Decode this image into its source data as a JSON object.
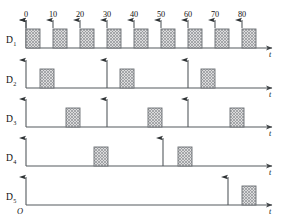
{
  "figure": {
    "origin_label": "O",
    "axis_label": "t",
    "tick_labels": [
      "0",
      "10",
      "20",
      "30",
      "40",
      "50",
      "60",
      "70",
      "80"
    ],
    "tick_x": [
      26,
      53,
      80,
      107,
      134,
      161,
      188,
      215,
      242
    ],
    "colors": {
      "line": "#555a5e",
      "pulse_fill": "#cfd0d1",
      "pulse_stroke": "#6b6f73",
      "text": "#111111",
      "background": "#ffffff"
    },
    "geometry": {
      "axis_x_start": 26,
      "axis_x_end": 272,
      "pulse_width": 14,
      "pulse_height": 19,
      "tick_spacing": 27
    }
  },
  "chart_data": {
    "type": "timing-diagram",
    "xlabel": "t",
    "xlim": [
      0,
      91
    ],
    "x_ticks": [
      0,
      10,
      20,
      30,
      40,
      50,
      60,
      70,
      80
    ],
    "x_tick_labels": [
      "0",
      "10",
      "20",
      "30",
      "40",
      "50",
      "60",
      "70",
      "80"
    ],
    "grid": false,
    "legend": "none",
    "origin": "O",
    "rows": [
      {
        "name": "D1",
        "label": "D",
        "subscript": "1",
        "baseline_y": 48,
        "top_ticks": true,
        "tick_arrow_x": [
          26,
          53,
          80,
          107,
          134,
          161,
          188,
          215,
          242
        ],
        "pulses_x": [
          26,
          53,
          80,
          107,
          134,
          161,
          188,
          215,
          242
        ],
        "pulses_t": [
          0,
          10,
          20,
          30,
          40,
          50,
          60,
          70,
          80
        ],
        "arrows_x": [],
        "arrows_t": []
      },
      {
        "name": "D2",
        "label": "D",
        "subscript": "2",
        "baseline_y": 88,
        "top_ticks": false,
        "tick_arrow_x": [],
        "pulses_x": [
          40,
          120,
          201
        ],
        "pulses_t": [
          5,
          35,
          65
        ],
        "arrows_x": [
          26,
          107,
          188
        ],
        "arrows_t": [
          0,
          30,
          60
        ]
      },
      {
        "name": "D3",
        "label": "D",
        "subscript": "3",
        "baseline_y": 127,
        "top_ticks": false,
        "tick_arrow_x": [],
        "pulses_x": [
          66,
          148,
          230
        ],
        "pulses_t": [
          15,
          45,
          75
        ],
        "arrows_x": [
          26,
          107,
          188
        ],
        "arrows_t": [
          0,
          30,
          60
        ]
      },
      {
        "name": "D4",
        "label": "D",
        "subscript": "4",
        "baseline_y": 166,
        "top_ticks": false,
        "tick_arrow_x": [],
        "pulses_x": [
          94,
          178
        ],
        "pulses_t": [
          25,
          56
        ],
        "arrows_x": [
          26,
          163
        ],
        "arrows_t": [
          0,
          51
        ]
      },
      {
        "name": "D5",
        "label": "D",
        "subscript": "5",
        "baseline_y": 205,
        "top_ticks": false,
        "tick_arrow_x": [],
        "pulses_x": [
          242
        ],
        "pulses_t": [
          80
        ],
        "arrows_x": [
          26,
          228
        ],
        "arrows_t": [
          0,
          75
        ]
      }
    ]
  }
}
